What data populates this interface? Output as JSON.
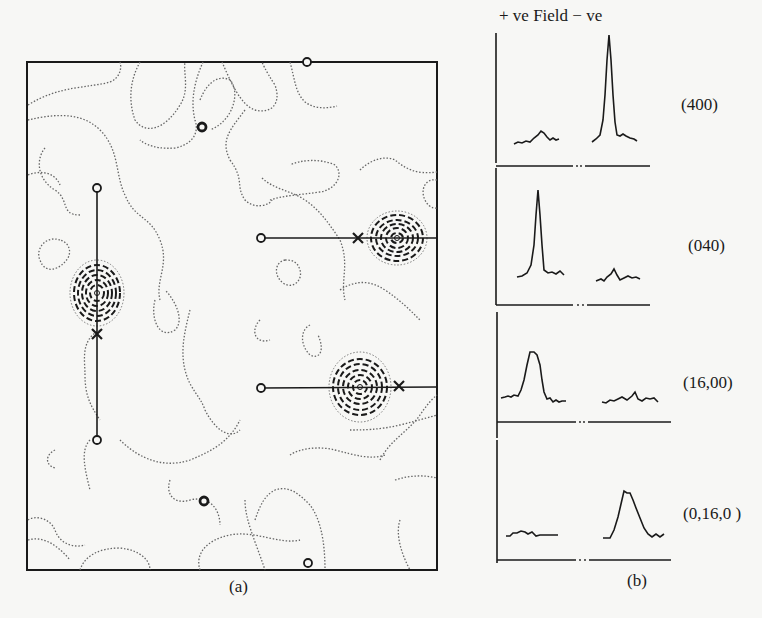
{
  "panel_a": {
    "caption": "(a)",
    "description": "Contour map with two positive peaks (dashed concentric contours) and two further peaks, connecting lines between circle markers and cross markers"
  },
  "panel_b": {
    "caption": "(b)",
    "header": "+ ve Field − ve",
    "traces": [
      {
        "label": "(400)",
        "positive_peak": "small",
        "negative_peak": "large sharp"
      },
      {
        "label": "(040)",
        "positive_peak": "large sharp",
        "negative_peak": "small"
      },
      {
        "label": "(16,00)",
        "positive_peak": "broad",
        "negative_peak": "none"
      },
      {
        "label": "(0,16,0 )",
        "positive_peak": "none",
        "negative_peak": "broad"
      }
    ]
  },
  "colors": {
    "ink": "#1a1a1a",
    "paper": "#f7f7f5",
    "contour": "#555555"
  }
}
